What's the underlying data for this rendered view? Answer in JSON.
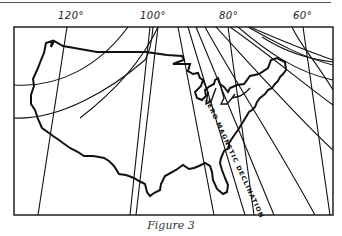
{
  "figure": {
    "caption": "Figure 3",
    "type": "isogonic map of the United States",
    "longitude_labels": [
      {
        "text": "120°",
        "value": 120
      },
      {
        "text": "100°",
        "value": 100
      },
      {
        "text": "80°",
        "value": 80
      },
      {
        "text": "60°",
        "value": 60
      }
    ],
    "annotation": "ZERO MAGNETIC DECLINATION",
    "colors": {
      "ink": "#111111",
      "background": "#ffffff",
      "rule": "#555555"
    }
  }
}
